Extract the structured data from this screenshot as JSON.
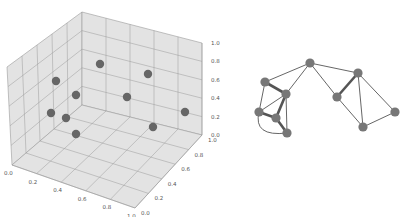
{
  "figure": {
    "width": 408,
    "height": 217,
    "background": "#ffffff"
  },
  "chart_data": [
    {
      "type": "scatter",
      "subtype": "3d",
      "title": "",
      "xlabel": "",
      "ylabel": "",
      "zlabel": "",
      "xlim": [
        0.0,
        1.0
      ],
      "ylim": [
        0.0,
        1.0
      ],
      "zlim": [
        0.0,
        1.0
      ],
      "grid": true,
      "x_ticks": [
        "0.0",
        "0.2",
        "0.4",
        "0.6",
        "0.8",
        "1.0"
      ],
      "y_ticks": [
        "0.0",
        "0.2",
        "0.4",
        "0.6",
        "0.8",
        "1.0"
      ],
      "z_ticks": [
        "0.0",
        "0.2",
        "0.4",
        "0.6",
        "0.8",
        "1.0"
      ],
      "pane_color": "#e3e3e3",
      "grid_color": "#9a9a9a",
      "point_color": "#666666",
      "num_points": 10,
      "points_screen": [
        {
          "x": 100,
          "y": 64
        },
        {
          "x": 148,
          "y": 74
        },
        {
          "x": 56,
          "y": 81
        },
        {
          "x": 76,
          "y": 95
        },
        {
          "x": 127,
          "y": 97
        },
        {
          "x": 51,
          "y": 113
        },
        {
          "x": 66,
          "y": 118
        },
        {
          "x": 185,
          "y": 112
        },
        {
          "x": 153,
          "y": 127
        },
        {
          "x": 76,
          "y": 134
        }
      ]
    },
    {
      "type": "network",
      "title": "",
      "node_color": "#777777",
      "edge_color": "#555555",
      "nodes": [
        {
          "id": "A",
          "x": 310,
          "y": 63
        },
        {
          "id": "B",
          "x": 358,
          "y": 73
        },
        {
          "id": "C",
          "x": 337,
          "y": 97
        },
        {
          "id": "D",
          "x": 395,
          "y": 112
        },
        {
          "id": "E",
          "x": 363,
          "y": 127
        },
        {
          "id": "F",
          "x": 265,
          "y": 82
        },
        {
          "id": "G",
          "x": 286,
          "y": 94
        },
        {
          "id": "H",
          "x": 259,
          "y": 112
        },
        {
          "id": "I",
          "x": 276,
          "y": 118
        },
        {
          "id": "J",
          "x": 287,
          "y": 133
        }
      ],
      "edges": [
        {
          "source": "A",
          "target": "F",
          "weight": 1
        },
        {
          "source": "A",
          "target": "G",
          "weight": 1
        },
        {
          "source": "A",
          "target": "B",
          "weight": 1
        },
        {
          "source": "A",
          "target": "C",
          "weight": 1
        },
        {
          "source": "B",
          "target": "C",
          "weight": 3
        },
        {
          "source": "B",
          "target": "E",
          "weight": 1
        },
        {
          "source": "B",
          "target": "D",
          "weight": 1
        },
        {
          "source": "C",
          "target": "E",
          "weight": 1
        },
        {
          "source": "D",
          "target": "E",
          "weight": 1
        },
        {
          "source": "F",
          "target": "G",
          "weight": 3
        },
        {
          "source": "F",
          "target": "H",
          "weight": 1
        },
        {
          "source": "G",
          "target": "H",
          "weight": 1
        },
        {
          "source": "G",
          "target": "I",
          "weight": 3
        },
        {
          "source": "G",
          "target": "J",
          "weight": 1
        },
        {
          "source": "H",
          "target": "I",
          "weight": 3
        },
        {
          "source": "I",
          "target": "J",
          "weight": 3
        },
        {
          "source": "H",
          "target": "J",
          "weight": 1,
          "curved": true
        }
      ]
    }
  ]
}
